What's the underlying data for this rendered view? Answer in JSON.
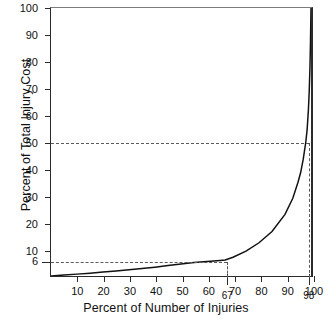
{
  "chart_data": {
    "type": "line",
    "title": "",
    "xlabel": "Percent of Number of Injuries",
    "ylabel": "Percent of Total Injury Cost",
    "xlim": [
      0,
      100
    ],
    "ylim": [
      0,
      100
    ],
    "grid": false,
    "legend": null,
    "x_ticks": [
      "10",
      "20",
      "30",
      "40",
      "50",
      "60",
      "70",
      "80",
      "90",
      "100"
    ],
    "x_special_ticks": [
      "67",
      "98"
    ],
    "y_ticks": [
      "10",
      "20",
      "30",
      "40",
      "50",
      "60",
      "70",
      "80",
      "90",
      "100"
    ],
    "y_special_ticks": [
      "6"
    ],
    "annotations": [
      {
        "label": "50",
        "type": "horizontal-reference-line",
        "value": 50
      },
      {
        "label": "6",
        "type": "horizontal-reference-line",
        "value": 6
      },
      {
        "label": "98",
        "type": "vertical-reference-line",
        "value": 98
      },
      {
        "label": "67",
        "type": "vertical-reference-line",
        "value": 67
      }
    ],
    "series": [
      {
        "name": "Cumulative injury cost",
        "x": [
          0,
          5,
          10,
          15,
          20,
          25,
          30,
          35,
          40,
          45,
          50,
          55,
          60,
          65,
          67,
          70,
          75,
          80,
          85,
          90,
          93,
          95,
          96,
          97,
          98,
          98.5,
          99,
          99.3,
          99.6,
          99.8,
          100
        ],
        "y": [
          0,
          0.35,
          0.7,
          1.05,
          1.45,
          1.85,
          2.3,
          2.8,
          3.3,
          3.9,
          4.5,
          5.0,
          5.4,
          5.8,
          6.0,
          7.0,
          9.3,
          12.4,
          16.6,
          23.0,
          29.0,
          35.0,
          38.5,
          43.5,
          50.0,
          54.5,
          62.0,
          68.5,
          78.0,
          87.0,
          100
        ]
      }
    ]
  },
  "axes": {
    "y_title": "Percent of Total Injury Cost",
    "x_title": "Percent of Number of Injuries",
    "y_tick_labels": [
      {
        "value": 100,
        "text": "100"
      },
      {
        "value": 90,
        "text": "90"
      },
      {
        "value": 80,
        "text": "80"
      },
      {
        "value": 70,
        "text": "70"
      },
      {
        "value": 60,
        "text": "60"
      },
      {
        "value": 50,
        "text": "50"
      },
      {
        "value": 40,
        "text": "40"
      },
      {
        "value": 30,
        "text": "30"
      },
      {
        "value": 20,
        "text": "20"
      },
      {
        "value": 10,
        "text": "10"
      },
      {
        "value": 6,
        "text": "6"
      }
    ],
    "x_tick_labels": [
      {
        "value": 10,
        "text": "10",
        "lower": false
      },
      {
        "value": 20,
        "text": "20",
        "lower": false
      },
      {
        "value": 30,
        "text": "30",
        "lower": false
      },
      {
        "value": 40,
        "text": "40",
        "lower": false
      },
      {
        "value": 50,
        "text": "50",
        "lower": false
      },
      {
        "value": 60,
        "text": "60",
        "lower": false
      },
      {
        "value": 67,
        "text": "67",
        "lower": true
      },
      {
        "value": 70,
        "text": "70",
        "lower": false
      },
      {
        "value": 80,
        "text": "80",
        "lower": false
      },
      {
        "value": 90,
        "text": "90",
        "lower": false
      },
      {
        "value": 98,
        "text": "98",
        "lower": true
      },
      {
        "value": 100,
        "text": "100",
        "lower": false
      }
    ]
  },
  "colors": {
    "curve": "#111111",
    "axis": "#2b2b2b",
    "dashed": "#5a5a5a",
    "background": "#ffffff"
  }
}
